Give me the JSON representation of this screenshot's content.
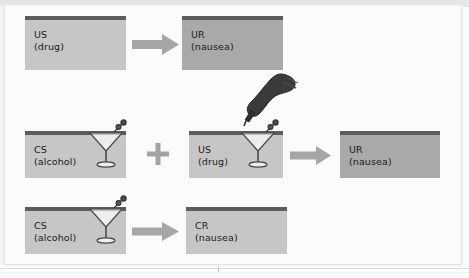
{
  "diagram": {
    "rows": [
      {
        "id": "row-acquisition-us",
        "boxes": [
          {
            "id": "us-drug-top",
            "code": "US",
            "detail": "(drug)",
            "shade": "light",
            "icon": "none"
          },
          {
            "id": "ur-nausea-top",
            "code": "UR",
            "detail": "(nausea)",
            "shade": "dark",
            "icon": "none"
          }
        ],
        "connector": "arrow-right"
      },
      {
        "id": "row-pairing",
        "boxes": [
          {
            "id": "cs-alcohol-mid",
            "code": "CS",
            "detail": "(alcohol)",
            "shade": "light",
            "icon": "martini-glass-icon"
          },
          {
            "id": "us-drug-mid",
            "code": "US",
            "detail": "(drug)",
            "shade": "light",
            "icon": "martini-glass-icon"
          },
          {
            "id": "ur-nausea-mid",
            "code": "UR",
            "detail": "(nausea)",
            "shade": "dark",
            "icon": "none"
          }
        ],
        "connector": "plus-then-arrow",
        "overlay_icon": "hand-with-dropper-icon"
      },
      {
        "id": "row-conditioned-response",
        "boxes": [
          {
            "id": "cs-alcohol-bottom",
            "code": "CS",
            "detail": "(alcohol)",
            "shade": "light",
            "icon": "martini-glass-icon"
          },
          {
            "id": "cr-nausea-bottom",
            "code": "CR",
            "detail": "(nausea)",
            "shade": "light",
            "icon": "none"
          }
        ],
        "connector": "arrow-right"
      }
    ],
    "symbols": {
      "plus": "+",
      "arrow": "→"
    },
    "colors": {
      "box_light": "#c6c6c6",
      "box_dark": "#a9a9a9",
      "box_top_bar": "#5c5c5c",
      "arrow": "#a6a6a6",
      "plus": "#a0a0a0",
      "text": "#1a1a1a",
      "background": "#fcfcfc",
      "border": "#e3e3e3"
    }
  }
}
